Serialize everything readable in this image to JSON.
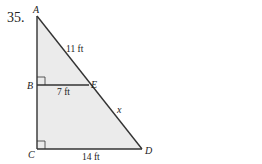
{
  "problem_number": "35.",
  "figure": {
    "vertices": {
      "A": "A",
      "B": "B",
      "C": "C",
      "D": "D",
      "E": "E"
    },
    "measurements": {
      "AE": "11 ft",
      "BE": "7 ft",
      "CD": "14 ft",
      "ED": "x"
    },
    "right_angles": [
      "B",
      "C"
    ],
    "fill_color": "#ebebeb",
    "line_color": "#333333"
  }
}
